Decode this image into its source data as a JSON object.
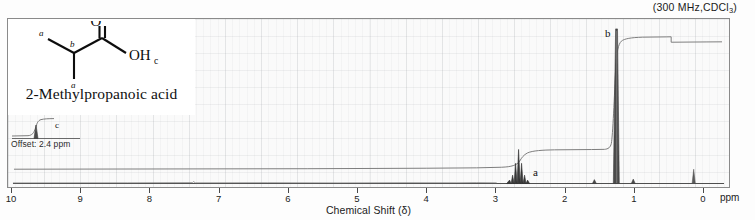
{
  "header": {
    "spectrometer": "(300 MHz,CDCl",
    "spectrometer_sub": "3",
    "spectrometer_tail": ")"
  },
  "structure": {
    "compound_name": "2-Methylpropanoic acid",
    "atom_o": "O",
    "atom_oh": "OH",
    "label_a_top": "a",
    "label_a_bottom": "a",
    "label_b": "b",
    "label_c": "c"
  },
  "offset_inset": {
    "text": "Offset: 2.4 ppm",
    "peak_label": "c"
  },
  "peak_labels": {
    "a": "a",
    "b": "b"
  },
  "axis": {
    "title": "Chemical Shift (δ)",
    "unit": "ppm",
    "ticks": [
      "10",
      "9",
      "8",
      "7",
      "6",
      "5",
      "4",
      "3",
      "2",
      "1",
      "0"
    ]
  },
  "chart_data": {
    "type": "line",
    "title": "",
    "subtitle": "(300 MHz,CDCl3)",
    "xlabel": "Chemical Shift (δ)",
    "ylabel": "",
    "xlim": [
      10,
      0
    ],
    "x_unit": "ppm",
    "grid": true,
    "legend": "none",
    "annotations": [
      {
        "text": "a",
        "shift_ppm": 2.55,
        "note": "septet, CH, 1H"
      },
      {
        "text": "b",
        "shift_ppm": 1.2,
        "note": "doublet, 2 x CH3, 6H"
      },
      {
        "text": "c",
        "shift_ppm": 12.0,
        "note": "COOH shown in offset inset at 2.4 ppm offset"
      }
    ],
    "series": [
      {
        "name": "1H NMR spectrum",
        "peaks": [
          {
            "label": "a",
            "shift_ppm": 2.55,
            "relative_height": 0.21,
            "multiplicity": "septet",
            "protons": 1
          },
          {
            "label": "b",
            "shift_ppm": 1.2,
            "relative_height": 1.0,
            "multiplicity": "doublet",
            "protons": 6
          },
          {
            "label": "TMS",
            "shift_ppm": 0.0,
            "relative_height": 0.07,
            "multiplicity": "singlet",
            "protons": 0
          }
        ]
      },
      {
        "name": "integration trace",
        "steps": [
          {
            "shift_ppm": 2.55,
            "label": "a",
            "relative_rise": 0.14
          },
          {
            "shift_ppm": 1.2,
            "label": "b",
            "relative_rise": 0.86
          }
        ]
      }
    ]
  }
}
